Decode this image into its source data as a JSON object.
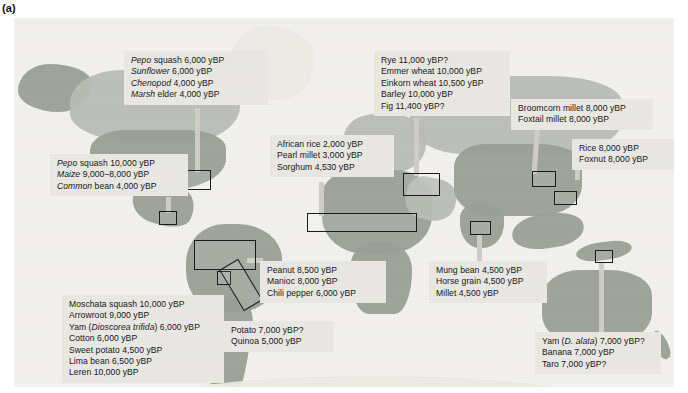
{
  "figure": {
    "panel_label": "(a)",
    "caption_units": "yBP"
  },
  "colors": {
    "callout_bg": "#e9e8e3",
    "text": "#17171a",
    "box_outline": "#1b1b1b",
    "ocean": "#f2f1ee",
    "land": "#b9bdb6"
  },
  "callouts": [
    {
      "id": "eastern-north-america",
      "lines": [
        "Pepo squash 6,000 yBP",
        "Sunflower 6,000 yBP",
        "Chenopod 4,000 yBP",
        "Marsh elder 4,000 yBP"
      ],
      "italic_first_word": true,
      "x": 110,
      "y": 33,
      "w": 130
    },
    {
      "id": "mesoamerica",
      "lines": [
        "Pepo squash 10,000 yBP",
        "Maize 9,000–8,000 yBP",
        "Common bean 4,000 yBP"
      ],
      "italic_first_word": true,
      "x": 36,
      "y": 136,
      "w": 124
    },
    {
      "id": "africa-sahel",
      "lines": [
        "African rice 2,000 yBP",
        "Pearl millet 3,000 yBP",
        "Sorghum 4,530 yBP"
      ],
      "italic_first_word": false,
      "x": 256,
      "y": 117,
      "w": 110
    },
    {
      "id": "fertile-crescent",
      "lines": [
        "Rye 11,000 yBP?",
        "Emmer wheat 10,000 yBP",
        "Einkorn wheat 10,500 yBP",
        "Barley 10,000 yBP",
        "Fig 11,400 yBP?"
      ],
      "italic_first_word": false,
      "x": 360,
      "y": 33,
      "w": 122
    },
    {
      "id": "north-china",
      "lines": [
        "Broomcorn millet 8,000 yBP",
        "Foxtail millet 8,000 yBP"
      ],
      "italic_first_word": false,
      "x": 497,
      "y": 81,
      "w": 128
    },
    {
      "id": "south-china",
      "lines": [
        "Rice 8,000 yBP",
        "Foxnut 8,000 yBP"
      ],
      "italic_first_word": false,
      "x": 558,
      "y": 121,
      "w": 90
    },
    {
      "id": "lowland-south-america",
      "lines": [
        "Peanut 8,500 yBP",
        "Manioc 8,000 yBP",
        "Chili pepper 6,000 yBP"
      ],
      "italic_first_word": false,
      "x": 246,
      "y": 243,
      "w": 112
    },
    {
      "id": "northern-south-america",
      "lines": [
        "Moschata squash 10,000 yBP",
        "Arrowroot 9,000 yBP",
        "Yam (Dioscorea trifida) 6,000 yBP",
        "Cotton 6,000 yBP",
        "Sweet potato 4,500 yBP",
        "Lima bean 6,500 yBP",
        "Leren 10,000 yBP"
      ],
      "italic_first_word": false,
      "italic_parenthetical": true,
      "x": 48,
      "y": 277,
      "w": 148
    },
    {
      "id": "andes",
      "lines": [
        "Potato 7,000 yBP?",
        "Quinoa 5,000 yBP"
      ],
      "italic_first_word": false,
      "x": 210,
      "y": 303,
      "w": 96
    },
    {
      "id": "south-asia",
      "lines": [
        "Mung bean 4,500 yBP",
        "Horse grain 4,500 yBP",
        "Millet 4,500 yBP"
      ],
      "italic_first_word": false,
      "x": 415,
      "y": 243,
      "w": 104
    },
    {
      "id": "new-guinea",
      "lines": [
        "Yam (D. alata) 7,000 yBP?",
        "Banana 7,000 yBP",
        "Taro 7,000 yBP?"
      ],
      "italic_first_word": false,
      "italic_parenthetical": true,
      "x": 521,
      "y": 314,
      "w": 112
    }
  ],
  "region_boxes": [
    {
      "id": "box-eastern-north-america",
      "x": 171,
      "y": 152,
      "w": 24,
      "h": 18,
      "rot": 0
    },
    {
      "id": "box-mesoamerica",
      "x": 145,
      "y": 193,
      "w": 16,
      "h": 12,
      "rot": 0
    },
    {
      "id": "box-africa-sahel",
      "x": 293,
      "y": 195,
      "w": 108,
      "h": 17,
      "rot": 0
    },
    {
      "id": "box-fertile-crescent",
      "x": 389,
      "y": 155,
      "w": 35,
      "h": 21,
      "rot": 0
    },
    {
      "id": "box-north-china",
      "x": 518,
      "y": 153,
      "w": 22,
      "h": 14,
      "rot": 0
    },
    {
      "id": "box-south-china",
      "x": 458,
      "y": 201,
      "w": 21,
      "h": 12,
      "rot": 0
    },
    {
      "id": "box-lowland-south-america",
      "x": 180,
      "y": 222,
      "w": 60,
      "h": 28,
      "rot": 0
    },
    {
      "id": "box-andes",
      "x": 203,
      "y": 253,
      "w": 12,
      "h": 12,
      "rot": 0
    },
    {
      "id": "box-andes-strip",
      "x": 216,
      "y": 243,
      "w": 20,
      "h": 46,
      "rot": -31
    },
    {
      "id": "box-south-asia",
      "x": 460,
      "y": 203,
      "w": 19,
      "h": 12,
      "rot": 0
    },
    {
      "id": "box-new-guinea",
      "x": 581,
      "y": 232,
      "w": 16,
      "h": 11,
      "rot": 0
    }
  ]
}
